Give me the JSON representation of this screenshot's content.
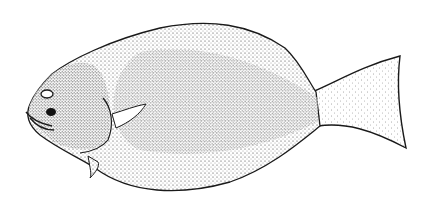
{
  "image": {
    "subject": "flatfish-illustration",
    "style": "stipple",
    "background": "#ffffff",
    "ink": "#1a1a1a",
    "fill_light": "#d9d9d9",
    "fill_dark": "#b0b0b0"
  }
}
